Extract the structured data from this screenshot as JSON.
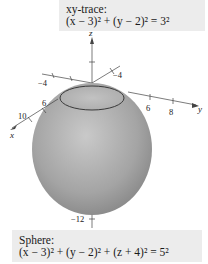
{
  "figure": {
    "top_caption": {
      "title": "xy-trace:",
      "equation": "(x − 3)² + (y − 2)² = 3²"
    },
    "bottom_caption": {
      "title": "Sphere:",
      "equation": "(x − 3)² + (y − 2)² + (z + 4)² = 5²"
    },
    "axes": {
      "z_label": "z",
      "y_label": "y",
      "x_label": "x",
      "x_ticks": [
        "−4",
        "6",
        "10"
      ],
      "y_ticks": [
        "−4",
        "6",
        "8"
      ],
      "z_ticks": [
        "−12"
      ]
    },
    "colors": {
      "sphere_light": "#cfcfcf",
      "sphere_dark": "#8c8c8c",
      "trace_line": "#3a3a3a",
      "caption_bg": "#ececec"
    }
  }
}
